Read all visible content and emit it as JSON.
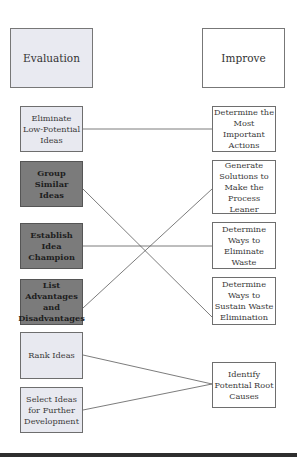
{
  "headers": {
    "left": "Evaluation",
    "right": "Improve"
  },
  "left_items": [
    {
      "label": "Eliminate Low-Potential Ideas",
      "style": "light"
    },
    {
      "label": "Group Similar Ideas",
      "style": "dark"
    },
    {
      "label": "Establish Idea Champion",
      "style": "dark"
    },
    {
      "label": "List Advantages and Disadvantages",
      "style": "dark"
    },
    {
      "label": "Rank Ideas",
      "style": "light"
    },
    {
      "label": "Select Ideas for Further Development",
      "style": "light"
    }
  ],
  "right_items": [
    {
      "label": "Determine the Most Important Actions"
    },
    {
      "label": "Generate Solutions to Make the Process Leaner"
    },
    {
      "label": "Determine Ways to Eliminate Waste"
    },
    {
      "label": "Determine Ways to Sustain Waste Elimination"
    },
    {
      "label": "Identify Potential Root Causes"
    }
  ],
  "connections": [
    {
      "from": "Eliminate Low-Potential Ideas",
      "to": "Determine the Most Important Actions"
    },
    {
      "from": "Group Similar Ideas",
      "to": "Determine Ways to Sustain Waste Elimination"
    },
    {
      "from": "Establish Idea Champion",
      "to": "Determine Ways to Eliminate Waste"
    },
    {
      "from": "List Advantages and Disadvantages",
      "to": "Generate Solutions to Make the Process Leaner"
    },
    {
      "from": "Rank Ideas",
      "to": "Identify Potential Root Causes"
    },
    {
      "from": "Select Ideas for Further Development",
      "to": "Identify Potential Root Causes"
    }
  ],
  "colors": {
    "light_fill": "#e8e9f0",
    "dark_fill": "#7b7b7b",
    "line": "#555555"
  }
}
